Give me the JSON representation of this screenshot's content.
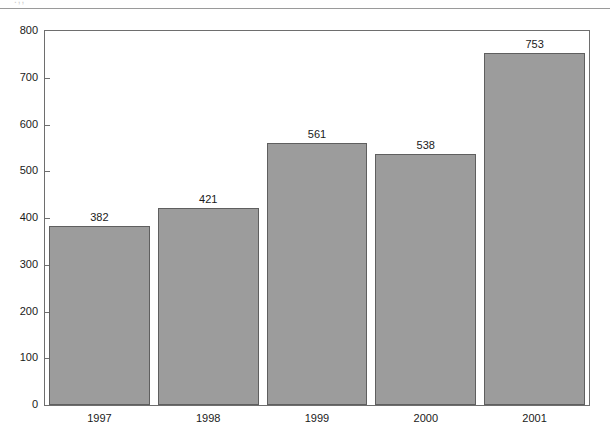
{
  "chart_data": {
    "type": "bar",
    "title": "",
    "subtitle": "",
    "xlabel": "",
    "ylabel": "",
    "categories": [
      "1997",
      "1998",
      "1999",
      "2000",
      "2001"
    ],
    "values": [
      382,
      421,
      561,
      538,
      753
    ],
    "series": [
      {
        "name": "",
        "values": [
          382,
          421,
          561,
          538,
          753
        ]
      }
    ],
    "ylim": [
      0,
      800
    ],
    "y_ticks": [
      0,
      100,
      200,
      300,
      400,
      500,
      600,
      700,
      800
    ],
    "y_tick_labels": [
      "0",
      "100",
      "200",
      "300",
      "400",
      "500",
      "600",
      "700",
      "800"
    ],
    "data_labels": [
      "382",
      "421",
      "561",
      "538",
      "753"
    ],
    "grid": false,
    "legend": null,
    "legend_position": "none",
    "annotations": [],
    "bar_color": "#9c9c9c",
    "bar_border_color": "#5f5f5f",
    "axis_color": "#6e6e6e",
    "text_color": "#1a1a1a",
    "background": "#ffffff"
  },
  "figure": {
    "top_fragment_text": ".,,",
    "plot_frame_name": "plot-area"
  }
}
